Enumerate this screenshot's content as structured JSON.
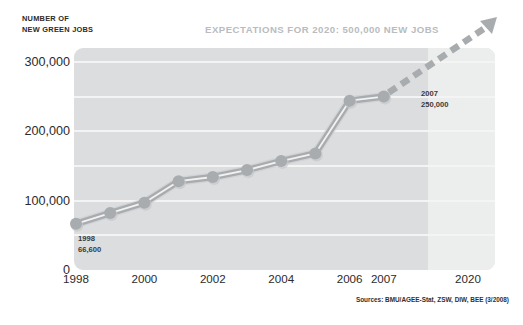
{
  "axis_title": {
    "line1": "NUMBER OF",
    "line2": "NEW GREEN JOBS"
  },
  "headline": "EXPECTATIONS FOR 2020: 500,000 NEW JOBS",
  "sources": "Sources: BMU/AGEE-Stat, ZSW, DIW, BEE (3/2008)",
  "colors": {
    "plot_background": "#dcdddf",
    "forecast_background": "#eceded",
    "gridline": "#f4f4f5",
    "series_line": "#a9acae",
    "series_highlight": "#f2f2f2",
    "marker": "#a9acae",
    "projection_arrow": "#a9acae",
    "headline_text": "#b9bcbe",
    "label_text": "#2b2b2b"
  },
  "annotations": [
    {
      "year": "1998",
      "value": "66,600"
    },
    {
      "year": "2007",
      "value": "250,000"
    }
  ],
  "chart_data": {
    "type": "line",
    "title": "EXPECTATIONS FOR 2020: 500,000 NEW JOBS",
    "xlabel": "",
    "ylabel": "NUMBER OF NEW GREEN JOBS",
    "grid": true,
    "legend": "none",
    "xlim": [
      1998,
      2020
    ],
    "ylim": [
      0,
      320000
    ],
    "yticks": [
      0,
      100000,
      200000,
      300000
    ],
    "ytick_labels": [
      "0",
      "100,000",
      "200,000",
      "300,000"
    ],
    "gridline_values": [
      50000,
      100000,
      150000,
      200000,
      250000,
      300000
    ],
    "xtick_labels": [
      "1998",
      "2000",
      "2002",
      "2004",
      "2006",
      "2007",
      "2020"
    ],
    "xtick_values": [
      1998,
      2000,
      2002,
      2004,
      2006,
      2007,
      2020
    ],
    "x": [
      1998,
      1999,
      2000,
      2001,
      2002,
      2003,
      2004,
      2005,
      2006,
      2007
    ],
    "values": [
      66600,
      82000,
      97000,
      128000,
      134000,
      144000,
      157000,
      168000,
      244000,
      250000
    ],
    "series": [
      {
        "name": "New green jobs",
        "x": [
          1998,
          1999,
          2000,
          2001,
          2002,
          2003,
          2004,
          2005,
          2006,
          2007
        ],
        "values": [
          66600,
          82000,
          97000,
          128000,
          134000,
          144000,
          157000,
          168000,
          244000,
          250000
        ]
      }
    ],
    "projection": {
      "style": "dashed-arrow",
      "from": {
        "x": 2007,
        "value": 250000
      },
      "to": {
        "x": 2020,
        "value": 500000
      },
      "label": "500,000"
    },
    "data_labels": [
      {
        "x": 1998,
        "value": 66600,
        "text": "1998 66,600"
      },
      {
        "x": 2007,
        "value": 250000,
        "text": "2007 250,000"
      }
    ]
  }
}
